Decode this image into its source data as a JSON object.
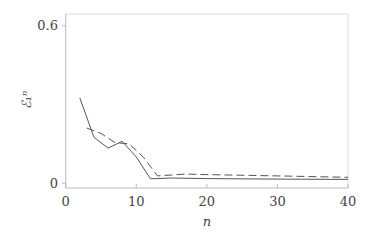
{
  "chart_data": {
    "type": "line",
    "title": "",
    "xlabel": "n",
    "ylabel": "ℰ₁ⁿ",
    "xlim": [
      0,
      40
    ],
    "ylim": [
      0,
      0.6
    ],
    "x_ticks": [
      "0",
      "10",
      "20",
      "30",
      "40"
    ],
    "y_ticks": [
      "0",
      "0.6"
    ],
    "grid": false,
    "legend": null,
    "series": [
      {
        "name": "solid",
        "style": "solid",
        "x": [
          2,
          4,
          6,
          8,
          10,
          12,
          15,
          20,
          30,
          40
        ],
        "y": [
          0.325,
          0.176,
          0.134,
          0.16,
          0.1,
          0.017,
          0.02,
          0.018,
          0.016,
          0.015
        ]
      },
      {
        "name": "dashed",
        "style": "dashed",
        "x": [
          3,
          5,
          7,
          9,
          11,
          13,
          17,
          20,
          30,
          40
        ],
        "y": [
          0.21,
          0.19,
          0.155,
          0.15,
          0.1,
          0.028,
          0.035,
          0.033,
          0.028,
          0.023
        ]
      }
    ]
  }
}
